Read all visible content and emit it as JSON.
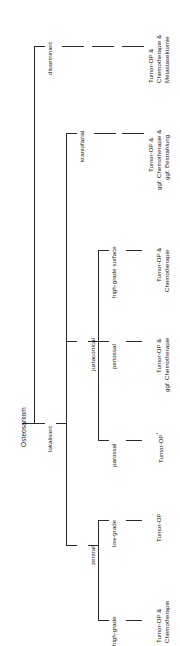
{
  "diagram": {
    "title": "Osteosarkom",
    "type": "decision-tree",
    "orientation": "rotated-90-ccw",
    "nodes": {
      "root": "Osteosarkom",
      "disseminiert": "disseminiert",
      "lokalisiert": "lokalisiert",
      "kraniofazial": "kraniofazial",
      "juxtacortical": "juxtacortical",
      "zentral": "zentral",
      "high_grade_surface": "high-grade surface",
      "periossal": "periossal",
      "parossal": "parossal",
      "low_grade": "low-grade",
      "high_grade": "high-grade"
    },
    "treatments": {
      "disseminiert": {
        "line1": "Tumor-OP &",
        "line2": "Chemotherapie &",
        "line3": "Metastasektomie"
      },
      "kraniofazial": {
        "line1": "Tumor-OP &",
        "line2": "ggf. Chemotherapie &",
        "line3": "ggf. Bestrahlung"
      },
      "high_grade_surface": {
        "line1": "Tumor-OP &",
        "line2": "Chemotherapie"
      },
      "periossal": {
        "line1": "Tumor-OP &",
        "line2": "ggf. Chemotherapie"
      },
      "parossal": {
        "line1": "Tumor-OP",
        "marker": "*"
      },
      "low_grade": {
        "line1": "Tumor-OP"
      },
      "high_grade": {
        "line1": "Tumor-OP &",
        "line2": "Chemotherapie"
      }
    }
  }
}
